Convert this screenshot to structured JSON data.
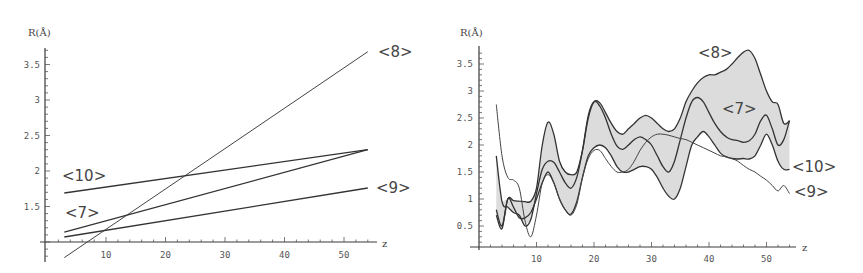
{
  "chart_data": [
    {
      "id": "left",
      "type": "line",
      "title": "",
      "xlabel": "z",
      "ylabel": "R(Å)",
      "xlim": [
        0,
        55
      ],
      "ylim": [
        0.7,
        3.75
      ],
      "x_axis_crosses_at": 1.0,
      "xticks": [
        10,
        20,
        30,
        40,
        50
      ],
      "yticks": [
        1.5,
        2,
        2.5,
        3,
        3.5
      ],
      "ytick_labels": [
        "1.5",
        "2",
        "2.5",
        "3",
        "3.5"
      ],
      "grid": false,
      "legend": "inline labels",
      "series": [
        {
          "name": "<8>",
          "x": [
            3,
            54
          ],
          "values": [
            0.78,
            3.68
          ]
        },
        {
          "name": "<10>",
          "x": [
            3,
            54
          ],
          "values": [
            1.69,
            2.3
          ]
        },
        {
          "name": "<7>",
          "x": [
            3,
            54
          ],
          "values": [
            1.14,
            2.3
          ]
        },
        {
          "name": "<9>",
          "x": [
            3,
            54
          ],
          "values": [
            1.07,
            1.76
          ]
        }
      ]
    },
    {
      "id": "right",
      "type": "line",
      "title": "",
      "xlabel": "z",
      "ylabel": "R(Å)",
      "xlim": [
        0,
        55
      ],
      "ylim": [
        0,
        3.8
      ],
      "xticks": [
        10,
        20,
        30,
        40,
        50
      ],
      "yticks": [
        0.5,
        1,
        1.5,
        2,
        2.5,
        3,
        3.5
      ],
      "ytick_labels": [
        "0.5",
        "1",
        "1.5",
        "2",
        "2.5",
        "3",
        "3.5"
      ],
      "grid": false,
      "legend": "inline labels",
      "shaded_band": "region between <8> and <7> upper/lower envelopes shaded light gray",
      "series": [
        {
          "name": "<8>",
          "x": [
            3,
            4,
            5,
            6,
            7,
            8,
            9,
            10,
            11,
            12,
            13,
            14,
            15,
            16,
            17,
            18,
            19,
            20,
            21,
            22,
            23,
            24,
            25,
            26,
            27,
            28,
            29,
            30,
            31,
            32,
            33,
            34,
            35,
            36,
            37,
            38,
            39,
            40,
            41,
            42,
            43,
            44,
            45,
            46,
            47,
            48,
            49,
            50,
            51,
            52,
            53,
            54
          ],
          "values": [
            0.8,
            0.5,
            1.0,
            0.97,
            0.96,
            0.95,
            0.96,
            1.2,
            2.0,
            2.42,
            2.2,
            1.7,
            1.5,
            1.45,
            1.5,
            1.9,
            2.5,
            2.8,
            2.78,
            2.6,
            2.4,
            2.25,
            2.2,
            2.3,
            2.4,
            2.5,
            2.55,
            2.5,
            2.4,
            2.3,
            2.25,
            2.3,
            2.5,
            2.8,
            3.0,
            3.15,
            3.25,
            3.3,
            3.3,
            3.35,
            3.4,
            3.5,
            3.62,
            3.72,
            3.75,
            3.6,
            3.3,
            3.0,
            2.8,
            2.75,
            2.4,
            2.45
          ]
        },
        {
          "name": "<7>",
          "x": [
            3,
            4,
            5,
            6,
            7,
            8,
            9,
            10,
            11,
            12,
            13,
            14,
            15,
            16,
            17,
            18,
            19,
            20,
            21,
            22,
            23,
            24,
            25,
            26,
            27,
            28,
            29,
            30,
            31,
            32,
            33,
            34,
            35,
            36,
            37,
            38,
            39,
            40,
            41,
            42,
            43,
            44,
            45,
            46,
            47,
            48,
            49,
            50,
            51,
            52,
            53,
            54
          ],
          "values": [
            1.8,
            0.95,
            0.85,
            0.75,
            0.7,
            0.5,
            0.62,
            1.1,
            1.55,
            1.7,
            1.68,
            1.5,
            1.3,
            1.2,
            1.4,
            1.9,
            2.55,
            2.8,
            2.72,
            2.5,
            2.2,
            1.98,
            1.92,
            2.0,
            2.1,
            2.15,
            2.1,
            2.0,
            1.8,
            1.6,
            1.5,
            1.7,
            2.1,
            2.5,
            2.8,
            2.88,
            2.8,
            2.6,
            2.4,
            2.25,
            2.15,
            2.1,
            2.08,
            2.05,
            2.08,
            2.2,
            2.45,
            2.55,
            2.3,
            2.0,
            2.1,
            2.45
          ]
        },
        {
          "name": "<10>",
          "x": [
            3,
            4,
            5,
            6,
            7,
            8,
            9,
            10,
            11,
            12,
            13,
            14,
            15,
            16,
            17,
            18,
            19,
            20,
            21,
            22,
            23,
            24,
            25,
            26,
            27,
            28,
            29,
            30,
            31,
            32,
            33,
            34,
            35,
            36,
            37,
            38,
            39,
            40,
            41,
            42,
            43,
            44,
            45,
            46,
            47,
            48,
            49,
            50,
            51,
            52,
            53,
            54
          ],
          "values": [
            0.7,
            0.45,
            1.0,
            0.85,
            0.65,
            0.65,
            0.75,
            1.0,
            1.3,
            1.5,
            1.3,
            1.0,
            0.8,
            0.72,
            0.95,
            1.4,
            1.8,
            1.95,
            2.0,
            1.95,
            1.8,
            1.6,
            1.5,
            1.5,
            1.55,
            1.6,
            1.6,
            1.55,
            1.4,
            1.2,
            1.05,
            1.0,
            1.2,
            1.6,
            2.0,
            2.15,
            2.25,
            2.15,
            2.0,
            1.85,
            1.78,
            1.75,
            1.74,
            1.75,
            1.74,
            1.8,
            2.0,
            2.2,
            2.0,
            1.7,
            1.55,
            1.55
          ]
        },
        {
          "name": "<9>",
          "x": [
            3,
            4,
            5,
            6,
            7,
            8,
            9,
            10,
            11,
            12,
            13,
            14,
            15,
            16,
            17,
            18,
            19,
            20,
            21,
            22,
            23,
            24,
            25,
            26,
            27,
            28,
            29,
            30,
            31,
            32,
            33,
            34,
            35,
            36,
            37,
            38,
            39,
            40,
            41,
            42,
            43,
            44,
            45,
            46,
            47,
            48,
            49,
            50,
            51,
            52,
            53,
            54
          ],
          "values": [
            2.75,
            1.8,
            1.4,
            1.35,
            1.2,
            0.6,
            0.3,
            0.7,
            1.3,
            1.45,
            1.3,
            1.0,
            0.8,
            0.7,
            0.9,
            1.4,
            1.75,
            1.9,
            1.9,
            1.75,
            1.6,
            1.5,
            1.5,
            1.55,
            1.7,
            1.9,
            2.05,
            2.15,
            2.2,
            2.2,
            2.18,
            2.15,
            2.12,
            2.1,
            2.05,
            2.0,
            1.95,
            1.9,
            1.85,
            1.8,
            1.78,
            1.75,
            1.7,
            1.62,
            1.55,
            1.5,
            1.42,
            1.35,
            1.25,
            1.15,
            1.25,
            1.1
          ]
        }
      ]
    }
  ],
  "labels": {
    "left": {
      "ylabel": "R(Å)",
      "xlabel": "z",
      "s8": "<8>",
      "s10": "<10>",
      "s7": "<7>",
      "s9": "<9>"
    },
    "right": {
      "ylabel": "R(Å)",
      "xlabel": "z",
      "s8": "<8>",
      "s7": "<7>",
      "s10": "<10>",
      "s9": "<9>"
    }
  }
}
